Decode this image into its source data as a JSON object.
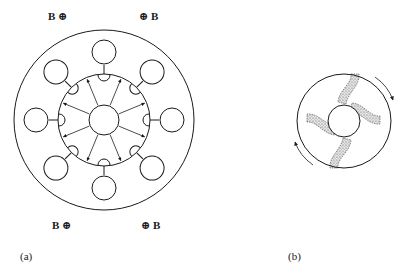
{
  "figure": {
    "panel_a": {
      "caption": "(a)",
      "field_labels": {
        "top_left": "B ⊕",
        "top_right": "⊕ B",
        "bottom_left": "B ⊕",
        "bottom_right": "⊕ B"
      },
      "bulb_count": 8,
      "radial_arrow_count": 8
    },
    "panel_b": {
      "caption": "(b)",
      "arms": 4,
      "rotation_arrows": 2
    },
    "colors": {
      "line": "#1a1a1a",
      "background": "#ffffff",
      "stipple": "#9a9a9a"
    }
  }
}
